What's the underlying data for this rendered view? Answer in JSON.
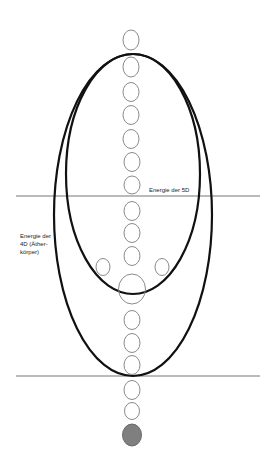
{
  "labels": {
    "energy_5d": "Energie der 5D",
    "energy_4d_line1": "Energie der",
    "energy_4d_line2": "4D (Äther-",
    "energy_4d_line3": "körper)"
  },
  "colors": {
    "ellipse_stroke": "#111111",
    "circle_stroke": "#8a8a8a",
    "line_stroke": "#777777",
    "filled_circle": "#7f7f7f"
  }
}
